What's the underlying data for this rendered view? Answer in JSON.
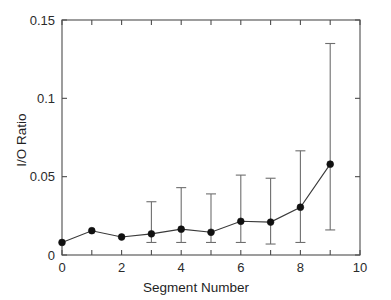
{
  "chart_data": {
    "type": "line",
    "title": "",
    "subtitle": "",
    "xlabel": "Segment Number",
    "ylabel": "I/O Ratio",
    "xlim": [
      0,
      10
    ],
    "ylim": [
      0,
      0.15
    ],
    "xticks": [
      0,
      1,
      2,
      3,
      4,
      5,
      6,
      7,
      8,
      9,
      10
    ],
    "xtick_labels": [
      "0",
      "",
      "2",
      "",
      "4",
      "",
      "6",
      "",
      "8",
      "",
      "10"
    ],
    "yticks": [
      0,
      0.05,
      0.1,
      0.15
    ],
    "ytick_labels": [
      "0",
      "0.05",
      "0.1",
      "0.15"
    ],
    "grid": false,
    "legend": null,
    "legend_position": "none",
    "marker": "filled-circle",
    "error_bars": "symmetric-vertical-with-caps",
    "x": [
      0,
      1,
      2,
      3,
      4,
      5,
      6,
      7,
      8,
      9
    ],
    "values": [
      0.008,
      0.0155,
      0.0115,
      0.0135,
      0.0165,
      0.0145,
      0.0215,
      0.021,
      0.0305,
      0.058
    ],
    "error_low": [
      0.008,
      0.0155,
      0.0115,
      0.0055,
      0.0085,
      0.0065,
      0.0135,
      0.0145,
      0.0225,
      0.042
    ],
    "error_high": [
      0.0,
      0.0,
      0.0,
      0.0205,
      0.0265,
      0.0245,
      0.0295,
      0.028,
      0.036,
      0.077
    ],
    "y_lower": [
      0.008,
      0.0155,
      0.0115,
      0.008,
      0.008,
      0.008,
      0.008,
      0.007,
      0.008,
      0.016
    ],
    "y_upper": [
      0.008,
      0.0155,
      0.0115,
      0.034,
      0.043,
      0.039,
      0.051,
      0.049,
      0.0665,
      0.135
    ],
    "colors": {
      "line": "#3a3a3a",
      "marker": "#111111",
      "error": "#6e6e6e",
      "axis": "#4d4d4d",
      "text": "#2b2b2b",
      "background": "#ffffff"
    }
  },
  "figure": {
    "background": "#ffffff",
    "axes_box": true
  }
}
